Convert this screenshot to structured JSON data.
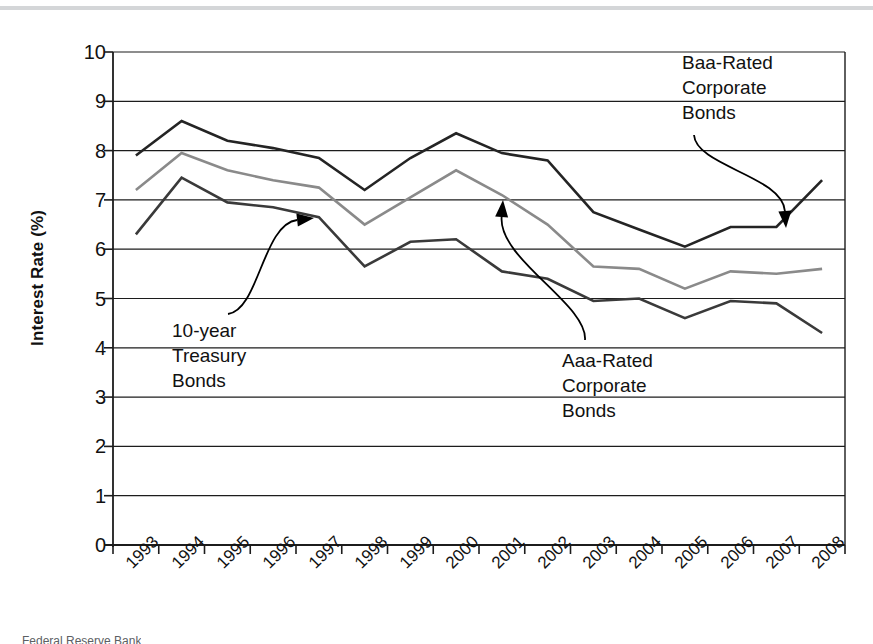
{
  "figure": {
    "ylabel": "Interest Rate (%)",
    "caption_partial": "Federal Reserve Bank"
  },
  "chart_data": {
    "type": "line",
    "title": "",
    "xlabel": "",
    "ylabel": "Interest Rate (%)",
    "ylim": [
      0,
      10
    ],
    "yticks": [
      0,
      1,
      2,
      3,
      4,
      5,
      6,
      7,
      8,
      9,
      10
    ],
    "ytick_labels": [
      "0",
      "1",
      "2",
      "3",
      "4",
      "5",
      "6",
      "7",
      "8",
      "9",
      "10"
    ],
    "grid": true,
    "grid_axis": "y",
    "legend": "none",
    "x_tick_rotation": -45,
    "categories": [
      "1993",
      "1994",
      "1995",
      "1996",
      "1997",
      "1998",
      "1999",
      "2000",
      "2001",
      "2002",
      "2003",
      "2004",
      "2005",
      "2006",
      "2007",
      "2008"
    ],
    "series": [
      {
        "name": "Baa-Rated Corporate Bonds",
        "color": "#242424",
        "values": [
          7.9,
          8.6,
          8.2,
          8.05,
          7.85,
          7.2,
          7.85,
          8.35,
          7.95,
          7.8,
          6.75,
          6.4,
          6.05,
          6.45,
          6.45,
          7.4
        ]
      },
      {
        "name": "Aaa-Rated Corporate Bonds",
        "color": "#8a8a8a",
        "values": [
          7.2,
          7.95,
          7.6,
          7.4,
          7.25,
          6.5,
          7.05,
          7.6,
          7.1,
          6.5,
          5.65,
          5.6,
          5.2,
          5.55,
          5.5,
          5.6
        ]
      },
      {
        "name": "10-year Treasury Bonds",
        "color": "#3a3a3a",
        "values": [
          6.3,
          7.45,
          6.95,
          6.85,
          6.65,
          5.65,
          6.15,
          6.2,
          5.55,
          5.4,
          4.95,
          5.0,
          4.6,
          4.95,
          4.9,
          4.3
        ]
      }
    ],
    "annotations": [
      {
        "id": "baa-annotation",
        "text": "Baa-Rated\nCorporate\nBonds",
        "label_x": 682,
        "label_y": 50,
        "arrow_from": [
          694,
          135
        ],
        "arrow_to": [
          786,
          228
        ]
      },
      {
        "id": "treasury-annotation",
        "text": "10-year\nTreasury\nBonds",
        "label_x": 172,
        "label_y": 318,
        "arrow_from": [
          228,
          314
        ],
        "arrow_to": [
          314,
          218
        ]
      },
      {
        "id": "aaa-annotation",
        "text": "Aaa-Rated\nCorporate\nBonds",
        "label_x": 562,
        "label_y": 348,
        "arrow_from": [
          585,
          340
        ],
        "arrow_to": [
          503,
          200
        ]
      }
    ]
  }
}
